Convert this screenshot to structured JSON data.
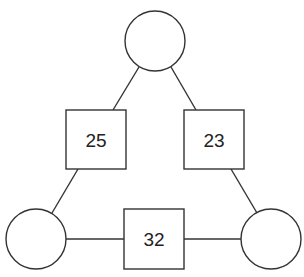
{
  "diagram": {
    "type": "number-triangle-puzzle",
    "circles": [
      {
        "id": "top",
        "value": ""
      },
      {
        "id": "bottom-left",
        "value": ""
      },
      {
        "id": "bottom-right",
        "value": ""
      }
    ],
    "boxes": [
      {
        "id": "left",
        "value": "25"
      },
      {
        "id": "right",
        "value": "23"
      },
      {
        "id": "bottom",
        "value": "32"
      }
    ],
    "colors": {
      "stroke": "#333333",
      "background": "#ffffff",
      "text": "#222222"
    }
  }
}
